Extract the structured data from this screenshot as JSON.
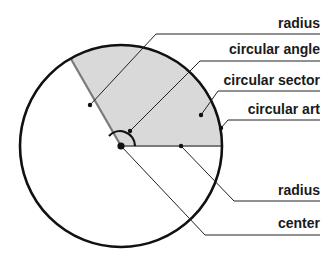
{
  "diagram": {
    "labels": {
      "radius_top": "radius",
      "circular_angle": "circular angle",
      "circular_sector": "circular sector",
      "circular_arc": "circular art",
      "radius_bottom": "radius",
      "center": "center"
    },
    "colors": {
      "sector_fill": "#d9d9d9",
      "outline": "#111111",
      "radius_line": "#7a7a7a",
      "leader": "#222222"
    }
  }
}
